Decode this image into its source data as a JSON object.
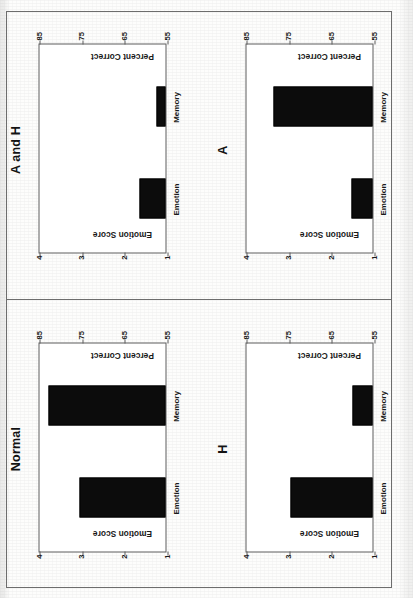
{
  "figure": {
    "orientation": "rotated-90-counterclockwise",
    "panel_order": [
      "A and H",
      "A",
      "Normal",
      "H"
    ]
  },
  "axes": {
    "left_title": "Emotion Score",
    "right_title": "Percent Correct",
    "emotion_ticks": [
      "1",
      "2",
      "3",
      "4"
    ],
    "percent_ticks": [
      "55",
      "65",
      "75",
      "85"
    ],
    "categories": [
      "Emotion",
      "Memory"
    ]
  },
  "colors": {
    "bar": "#0c0c0c",
    "axis": "#5c5c5c",
    "frame": "#6d6d6d",
    "text": "#1a1a1a",
    "paper": "#fdfdfc"
  },
  "panels": [
    {
      "id": "a-and-h",
      "title": "A and H",
      "bars": [
        {
          "category": "Emotion",
          "emotion_score": 1.62,
          "percent_correct": 59.2
        },
        {
          "category": "Memory",
          "emotion_score": 1.21,
          "percent_correct": 56.1
        }
      ]
    },
    {
      "id": "a",
      "title": "A",
      "bars": [
        {
          "category": "Emotion",
          "emotion_score": 1.5,
          "percent_correct": 58.3
        },
        {
          "category": "Memory",
          "emotion_score": 3.32,
          "percent_correct": 76.5
        }
      ]
    },
    {
      "id": "normal",
      "title": "Normal",
      "bars": [
        {
          "category": "Emotion",
          "emotion_score": 3.02,
          "percent_correct": 74.0
        },
        {
          "category": "Memory",
          "emotion_score": 3.74,
          "percent_correct": 79.5
        }
      ]
    },
    {
      "id": "h",
      "title": "H",
      "bars": [
        {
          "category": "Emotion",
          "emotion_score": 2.92,
          "percent_correct": 73.2
        },
        {
          "category": "Memory",
          "emotion_score": 1.48,
          "percent_correct": 58.1
        }
      ]
    }
  ],
  "chart_data": [
    {
      "type": "bar",
      "title": "A and H",
      "categories": [
        "Emotion",
        "Memory"
      ],
      "values": [
        1.62,
        1.21
      ],
      "xlabel": "",
      "ylabel": "Emotion Score",
      "ylabel_secondary": "Percent Correct",
      "ylim": [
        1,
        4
      ],
      "ylim_secondary": [
        55,
        85
      ],
      "yticks": [
        1,
        2,
        3,
        4
      ],
      "yticks_secondary": [
        55,
        65,
        75,
        85
      ],
      "grid": false,
      "legend": "none"
    },
    {
      "type": "bar",
      "title": "A",
      "categories": [
        "Emotion",
        "Memory"
      ],
      "values": [
        1.5,
        3.32
      ],
      "xlabel": "",
      "ylabel": "Emotion Score",
      "ylabel_secondary": "Percent Correct",
      "ylim": [
        1,
        4
      ],
      "ylim_secondary": [
        55,
        85
      ],
      "yticks": [
        1,
        2,
        3,
        4
      ],
      "yticks_secondary": [
        55,
        65,
        75,
        85
      ],
      "grid": false,
      "legend": "none"
    },
    {
      "type": "bar",
      "title": "Normal",
      "categories": [
        "Emotion",
        "Memory"
      ],
      "values": [
        3.02,
        3.74
      ],
      "xlabel": "",
      "ylabel": "Emotion Score",
      "ylabel_secondary": "Percent Correct",
      "ylim": [
        1,
        4
      ],
      "ylim_secondary": [
        55,
        85
      ],
      "yticks": [
        1,
        2,
        3,
        4
      ],
      "yticks_secondary": [
        55,
        65,
        75,
        85
      ],
      "grid": false,
      "legend": "none"
    },
    {
      "type": "bar",
      "title": "H",
      "categories": [
        "Emotion",
        "Memory"
      ],
      "values": [
        2.92,
        1.48
      ],
      "xlabel": "",
      "ylabel": "Emotion Score",
      "ylabel_secondary": "Percent Correct",
      "ylim": [
        1,
        4
      ],
      "ylim_secondary": [
        55,
        85
      ],
      "yticks": [
        1,
        2,
        3,
        4
      ],
      "yticks_secondary": [
        55,
        65,
        75,
        85
      ],
      "grid": false,
      "legend": "none"
    }
  ]
}
